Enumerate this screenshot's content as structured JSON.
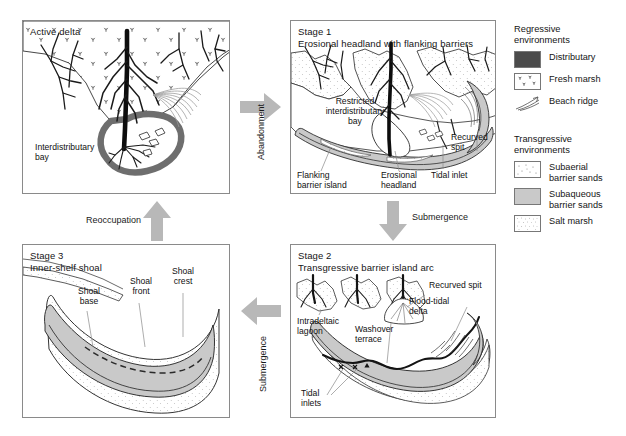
{
  "panels": {
    "active_delta": {
      "title_line1": "Active delta",
      "title_line2": "",
      "labels": {
        "interdistributary_bay_l1": "Interdistributary",
        "interdistributary_bay_l2": "bay"
      }
    },
    "stage1": {
      "title_line1": "Stage 1",
      "title_line2": "Erosional headland with flanking barriers",
      "labels": {
        "restricted_bay_l1": "Restricted",
        "restricted_bay_l2": "interdistributary",
        "restricted_bay_l3": "bay",
        "recurved_spit_l1": "Recurved",
        "recurved_spit_l2": "spit",
        "flanking_barrier_l1": "Flanking",
        "flanking_barrier_l2": "barrier island",
        "erosional_headland_l1": "Erosional",
        "erosional_headland_l2": "headland",
        "tidal_inlet": "Tidal inlet"
      }
    },
    "stage2": {
      "title_line1": "Stage 2",
      "title_line2": "Transgressive barrier island arc",
      "labels": {
        "recurved_spit": "Recurved spit",
        "flood_tidal_delta_l1": "Flood-tidal",
        "flood_tidal_delta_l2": "delta",
        "intradeltaic_lagoon_l1": "Intradeltaic",
        "intradeltaic_lagoon_l2": "lagoon",
        "washover_terrace_l1": "Washover",
        "washover_terrace_l2": "terrace",
        "tidal_inlets_l1": "Tidal",
        "tidal_inlets_l2": "inlets"
      }
    },
    "stage3": {
      "title_line1": "Stage 3",
      "title_line2": "Inner-shelf shoal",
      "labels": {
        "shoal_crest_l1": "Shoal",
        "shoal_crest_l2": "crest",
        "shoal_front_l1": "Shoal",
        "shoal_front_l2": "front",
        "shoal_base_l1": "Shoal",
        "shoal_base_l2": "base"
      }
    }
  },
  "arrows": {
    "abandonment": "Abandonment",
    "reoccupation": "Reoccupation",
    "submergence_down": "Submergence",
    "submergence_left": "Submergence"
  },
  "legend": {
    "regressive_head_l1": "Regressive",
    "regressive_head_l2": "environments",
    "transgressive_head_l1": "Transgressive",
    "transgressive_head_l2": "environments",
    "items_regressive": [
      {
        "label": "Distributary",
        "label2": ""
      },
      {
        "label": "Fresh marsh",
        "label2": ""
      },
      {
        "label": "Beach ridge",
        "label2": ""
      }
    ],
    "items_transgressive": [
      {
        "label": "Subaerial",
        "label2": "barrier sands"
      },
      {
        "label": "Subaqueous",
        "label2": "barrier sands"
      },
      {
        "label": "Salt marsh",
        "label2": ""
      }
    ]
  },
  "colors": {
    "distributary": "#4b4b4b",
    "subaqueous": "#c9c9c9",
    "subaerial": "#ffffff",
    "arrow_gray": "#b8b8b8",
    "panel_border": "#8a8a8a",
    "lagoon_gray": "#d8d8d8"
  }
}
